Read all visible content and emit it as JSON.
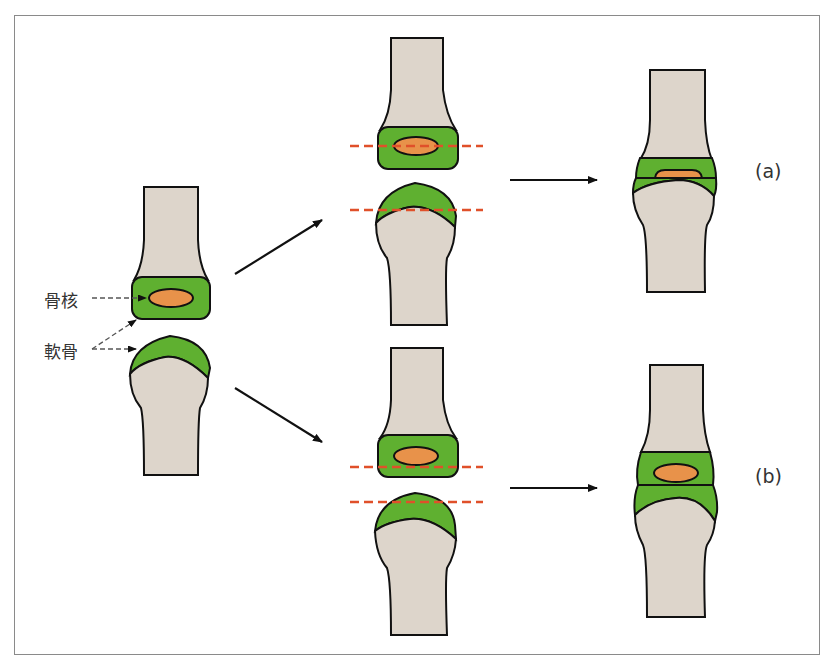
{
  "diagram": {
    "labels": {
      "ossification_center": "骨核",
      "cartilage": "軟骨"
    },
    "cases": [
      {
        "id": "a",
        "label": "(a)"
      },
      {
        "id": "b",
        "label": "(b)"
      }
    ],
    "colors": {
      "bone": "#ddd5cb",
      "cartilage": "#5fb030",
      "nucleus": "#e8924a",
      "outline": "#111111",
      "cut_line": "#e0502a",
      "arrow": "#111111",
      "frame": "#8a8a8a",
      "label_text": "#333333"
    }
  }
}
